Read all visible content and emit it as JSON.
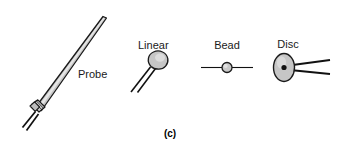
{
  "figure": {
    "caption": "(c)",
    "background_color": "#ffffff",
    "outline_color": "#1a1a1a",
    "body_fill_color": "#c8c8c8",
    "highlight_color": "#e0e0e0",
    "lead_color": "#111111",
    "label_color": "#1a1a1a"
  },
  "parts": [
    {
      "id": "probe",
      "label": "Probe",
      "shape": "tapered-needle",
      "lead_count": 2
    },
    {
      "id": "linear",
      "label": "Linear",
      "shape": "teardrop-bulb",
      "lead_count": 2
    },
    {
      "id": "bead",
      "label": "Bead",
      "shape": "small-circle-on-wire",
      "lead_count": 2
    },
    {
      "id": "disc",
      "label": "Disc",
      "shape": "ellipse-with-center-dot",
      "lead_count": 2
    }
  ]
}
